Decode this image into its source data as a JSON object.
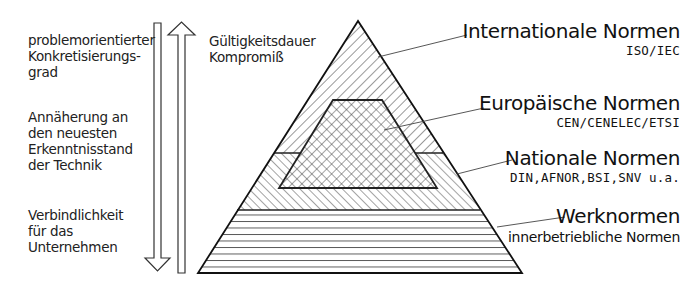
{
  "left_axis": {
    "groups": [
      {
        "lines": [
          "problemorientierter",
          "Konkretisierungs-",
          "grad"
        ]
      },
      {
        "lines": [
          "Annäherung an",
          "den neuesten",
          "Erkenntnisstand",
          "der Technik"
        ]
      },
      {
        "lines": [
          "Verbindlichkeit",
          "für das",
          "Unternehmen"
        ]
      }
    ],
    "arrow_direction": "down"
  },
  "right_axis": {
    "lines": [
      "Gültigkeitsdauer",
      "Kompromiß"
    ],
    "arrow_direction": "up"
  },
  "pyramid": {
    "tiers": [
      {
        "id": "international",
        "title": "Internationale Normen",
        "subtitle": "ISO/IEC",
        "pattern": "diagonal-hatch-back"
      },
      {
        "id": "european",
        "title": "Europäische Normen",
        "subtitle": "CEN/CENELEC/ETSI",
        "pattern": "crosshatch"
      },
      {
        "id": "national",
        "title": "Nationale Normen",
        "subtitle": "DIN,AFNOR,BSI,SNV u.a.",
        "pattern": "diagonal-hatch-forward"
      },
      {
        "id": "company",
        "title": "Werknormen",
        "subtitle": "innerbetriebliche Normen",
        "pattern": "horizontal-lines"
      }
    ]
  }
}
